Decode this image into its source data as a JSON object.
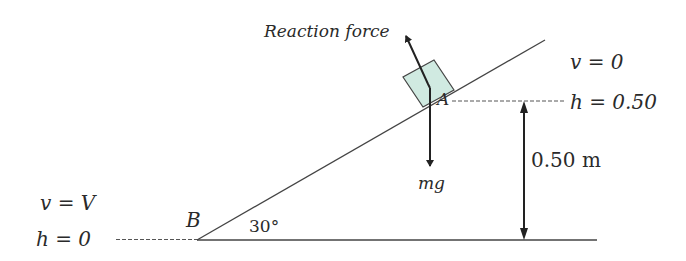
{
  "diagram": {
    "colors": {
      "line": "#333333",
      "block_fill": "#d0eae1",
      "block_stroke": "#444444",
      "text": "#2a2a2a"
    },
    "labels": {
      "reaction_force": "Reaction force",
      "point_a": "A",
      "point_b": "B",
      "weight": "mg",
      "angle": "30°",
      "height_dimension": "0.50 m",
      "top_velocity": "v = 0",
      "top_height": "h = 0.50",
      "bottom_velocity": "v = V",
      "bottom_height": "h = 0"
    },
    "geometry": {
      "incline_angle_deg": 30,
      "height_m": 0.5
    }
  }
}
